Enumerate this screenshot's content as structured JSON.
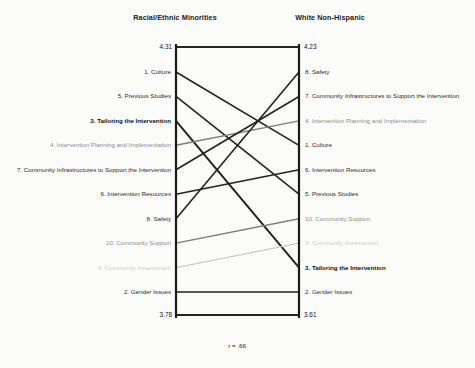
{
  "columns": {
    "left_title": "Racial/Ethnic Minorities",
    "right_title": "White Non-Hispanic"
  },
  "annotation": {
    "correlation": "r = .66"
  },
  "endpoints": {
    "left_top": "4.31",
    "left_bottom": "3.78",
    "right_top": "4.23",
    "right_bottom": "3.61"
  },
  "chart_data": {
    "type": "line",
    "subtype": "slope-ladder",
    "title": "",
    "xlabel": "",
    "ylabel": "",
    "axes": [
      "Racial/Ethnic Minorities",
      "White Non-Hispanic"
    ],
    "axis_value_range_left": [
      3.78,
      4.31
    ],
    "axis_value_range_right": [
      3.61,
      4.23
    ],
    "grid": false,
    "legend": "none",
    "annotations": [
      "r = .66"
    ],
    "left_order": [
      "1. Culture",
      "5. Previous Studies",
      "3. Tailoring the Intervention",
      "4. Intervention Planning and Implementation",
      "7. Community Infrastructures to Support the Intervention",
      "6. Intervention Resources",
      "8. Safety",
      "10. Community Support",
      "9. Community Assessment",
      "2. Gender Issues"
    ],
    "right_order": [
      "8. Safety",
      "7. Community Infrastructures to Support the Intervention",
      "4. Intervention Planning and Implementation",
      "1. Culture",
      "6. Intervention Resources",
      "5. Previous Studies",
      "10. Community Support",
      "9. Community Assessment",
      "3. Tailoring the Intervention",
      "2. Gender Issues"
    ],
    "items": [
      {
        "id": 1,
        "label": "1. Culture",
        "left_rank": 1,
        "right_rank": 4,
        "tone": "normal"
      },
      {
        "id": 5,
        "label": "5. Previous Studies",
        "left_rank": 2,
        "right_rank": 6,
        "tone": "normal"
      },
      {
        "id": 3,
        "label": "3. Tailoring the Intervention",
        "left_rank": 3,
        "right_rank": 9,
        "tone": "dark"
      },
      {
        "id": 4,
        "label": "4. Intervention Planning and Implementation",
        "left_rank": 4,
        "right_rank": 3,
        "tone": "mid"
      },
      {
        "id": 7,
        "label": "7. Community Infrastructures to Support the Intervention",
        "left_rank": 5,
        "right_rank": 2,
        "tone": "normal"
      },
      {
        "id": 6,
        "label": "6. Intervention Resources",
        "left_rank": 6,
        "right_rank": 5,
        "tone": "normal"
      },
      {
        "id": 8,
        "label": "8. Safety",
        "left_rank": 7,
        "right_rank": 1,
        "tone": "normal"
      },
      {
        "id": 10,
        "label": "10. Community Support",
        "left_rank": 8,
        "right_rank": 7,
        "tone": "mid"
      },
      {
        "id": 9,
        "label": "9. Community Assessment",
        "left_rank": 9,
        "right_rank": 8,
        "tone": "faint"
      },
      {
        "id": 2,
        "label": "2. Gender Issues",
        "left_rank": 10,
        "right_rank": 10,
        "tone": "normal"
      }
    ]
  },
  "colors": {
    "axis": "#1b1b1b",
    "line_dark": "#232323",
    "line_mid": "#7d7d7d",
    "line_faint": "#c9c9c9",
    "text": "#222222"
  }
}
